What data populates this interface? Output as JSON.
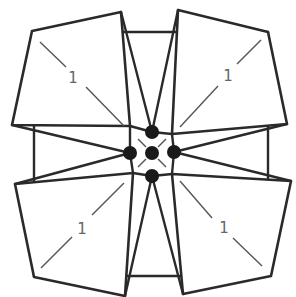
{
  "diagram": {
    "background_square": {
      "x1": 34,
      "y1": 32,
      "x2": 268,
      "y2": 276
    },
    "quads": [
      {
        "id": "top-left",
        "label": "1",
        "points": [
          [
            32,
            31
          ],
          [
            121,
            12
          ],
          [
            130,
            126
          ],
          [
            12,
            125
          ]
        ],
        "diag": [
          [
            40,
            42
          ],
          [
            66,
            67
          ],
          [
            86,
            87
          ],
          [
            124,
            126
          ]
        ],
        "label_pos": [
          73,
          78
        ]
      },
      {
        "id": "top-right",
        "label": "1",
        "points": [
          [
            178,
            10
          ],
          [
            268,
            32
          ],
          [
            287,
            124
          ],
          [
            172,
            134
          ]
        ],
        "diag": [
          [
            261,
            40
          ],
          [
            237,
            64
          ],
          [
            218,
            86
          ],
          [
            180,
            127
          ]
        ],
        "label_pos": [
          228,
          76
        ]
      },
      {
        "id": "bottom-left",
        "label": "1",
        "points": [
          [
            15,
            184
          ],
          [
            133,
            173
          ],
          [
            125,
            296
          ],
          [
            34,
            277
          ]
        ],
        "diag": [
          [
            124,
            183
          ],
          [
            92,
            215
          ],
          [
            72,
            237
          ],
          [
            41,
            268
          ]
        ],
        "label_pos": [
          82,
          229
        ]
      },
      {
        "id": "bottom-right",
        "label": "1",
        "points": [
          [
            172,
            174
          ],
          [
            291,
            181
          ],
          [
            271,
            276
          ],
          [
            183,
            294
          ]
        ],
        "diag": [
          [
            180,
            181
          ],
          [
            212,
            218
          ],
          [
            233,
            238
          ],
          [
            262,
            266
          ]
        ],
        "label_pos": [
          224,
          228
        ]
      }
    ],
    "dots": [
      {
        "id": "center",
        "cx": 152,
        "cy": 153,
        "r": 7
      },
      {
        "id": "top",
        "cx": 152,
        "cy": 132,
        "r": 7
      },
      {
        "id": "left",
        "cx": 130,
        "cy": 153,
        "r": 7
      },
      {
        "id": "right",
        "cx": 174,
        "cy": 152,
        "r": 7
      },
      {
        "id": "bottom",
        "cx": 152,
        "cy": 176,
        "r": 7
      }
    ],
    "colors": {
      "stroke": "#2a2a2a",
      "dot": "#1a1a1a",
      "label": "#666666",
      "background": "#ffffff"
    }
  }
}
